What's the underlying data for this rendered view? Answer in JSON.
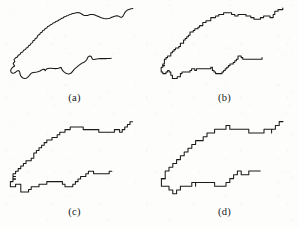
{
  "figure": {
    "kind": "multi-panel-line-figure",
    "background_color": "#fdfdfc",
    "line_color": "#1a1a1a",
    "panel_count": 4,
    "panel_layout": "2x2"
  },
  "panels": [
    {
      "id": "a",
      "caption": "(a)",
      "position": "top-left",
      "step": 0.0,
      "description": "smooth continuous coastline outline, finest resolution"
    },
    {
      "id": "b",
      "caption": "(b)",
      "position": "top-right",
      "step": 1.6,
      "description": "coastline outline, slightly coarser digitisation"
    },
    {
      "id": "c",
      "caption": "(c)",
      "position": "bottom-left",
      "step": 2.6,
      "description": "coastline outline, coarse digitisation with visible steps"
    },
    {
      "id": "d",
      "caption": "(d)",
      "position": "bottom-right",
      "step": 3.8,
      "description": "coastline outline, coarsest digitisation, strongly stair-stepped"
    }
  ],
  "chart_data": {
    "type": "line",
    "title": "",
    "xlabel": "",
    "ylabel": "",
    "xlim": [
      0,
      149
    ],
    "ylim": [
      0,
      96
    ],
    "grid": false,
    "legend": "none",
    "series": [
      {
        "name": "north-coast",
        "comment": "upper shoreline, traced left tip to right tip",
        "points": [
          [
            14.5,
            66.0
          ],
          [
            13.2,
            63.4
          ],
          [
            14.8,
            61.6
          ],
          [
            14.0,
            59.5
          ],
          [
            15.6,
            57.8
          ],
          [
            17.4,
            57.0
          ],
          [
            18.2,
            55.2
          ],
          [
            20.0,
            54.4
          ],
          [
            21.0,
            52.6
          ],
          [
            22.8,
            51.9
          ],
          [
            23.6,
            50.2
          ],
          [
            25.4,
            49.6
          ],
          [
            26.3,
            48.0
          ],
          [
            27.8,
            47.4
          ],
          [
            28.6,
            45.8
          ],
          [
            30.2,
            45.0
          ],
          [
            31.0,
            43.4
          ],
          [
            32.6,
            42.6
          ],
          [
            33.0,
            40.8
          ],
          [
            34.6,
            40.2
          ],
          [
            35.2,
            38.6
          ],
          [
            36.8,
            38.0
          ],
          [
            37.4,
            36.4
          ],
          [
            38.2,
            35.0
          ],
          [
            39.8,
            34.4
          ],
          [
            40.4,
            32.8
          ],
          [
            42.0,
            32.2
          ],
          [
            42.8,
            30.6
          ],
          [
            44.4,
            30.0
          ],
          [
            45.2,
            28.6
          ],
          [
            46.8,
            28.0
          ],
          [
            47.6,
            26.6
          ],
          [
            49.2,
            26.0
          ],
          [
            50.4,
            24.8
          ],
          [
            52.0,
            24.2
          ],
          [
            53.2,
            23.0
          ],
          [
            54.8,
            22.6
          ],
          [
            56.0,
            21.4
          ],
          [
            57.6,
            21.0
          ],
          [
            58.8,
            20.0
          ],
          [
            60.2,
            19.4
          ],
          [
            61.4,
            18.4
          ],
          [
            62.8,
            18.0
          ],
          [
            64.0,
            17.0
          ],
          [
            65.4,
            16.6
          ],
          [
            66.8,
            15.8
          ],
          [
            68.2,
            15.4
          ],
          [
            69.6,
            14.6
          ],
          [
            71.0,
            14.2
          ],
          [
            72.4,
            13.6
          ],
          [
            73.8,
            13.4
          ],
          [
            75.2,
            13.0
          ],
          [
            76.6,
            12.8
          ],
          [
            78.0,
            12.6
          ],
          [
            79.4,
            12.8
          ],
          [
            80.8,
            13.4
          ],
          [
            82.0,
            14.2
          ],
          [
            83.2,
            15.0
          ],
          [
            84.6,
            15.4
          ],
          [
            86.0,
            15.6
          ],
          [
            87.4,
            15.4
          ],
          [
            88.8,
            15.0
          ],
          [
            90.2,
            14.6
          ],
          [
            91.6,
            14.4
          ],
          [
            93.0,
            14.4
          ],
          [
            94.4,
            14.8
          ],
          [
            95.8,
            15.4
          ],
          [
            97.2,
            16.0
          ],
          [
            98.6,
            16.6
          ],
          [
            100.0,
            17.2
          ],
          [
            101.4,
            17.8
          ],
          [
            102.8,
            18.2
          ],
          [
            104.2,
            18.6
          ],
          [
            105.6,
            18.8
          ],
          [
            107.0,
            18.8
          ],
          [
            108.4,
            18.6
          ],
          [
            109.8,
            18.2
          ],
          [
            111.2,
            17.6
          ],
          [
            112.6,
            17.0
          ],
          [
            114.0,
            16.4
          ],
          [
            115.4,
            16.0
          ],
          [
            116.8,
            15.8
          ],
          [
            118.2,
            16.0
          ],
          [
            119.4,
            16.6
          ],
          [
            120.6,
            17.2
          ],
          [
            121.8,
            17.2
          ],
          [
            122.8,
            16.4
          ],
          [
            123.6,
            15.0
          ],
          [
            124.4,
            13.4
          ],
          [
            125.4,
            11.8
          ],
          [
            126.6,
            10.6
          ],
          [
            128.0,
            9.8
          ],
          [
            129.6,
            9.2
          ],
          [
            131.2,
            8.8
          ],
          [
            132.8,
            8.6
          ]
        ]
      },
      {
        "name": "south-coast",
        "comment": "lower shoreline, traced left tip to right tip",
        "points": [
          [
            14.5,
            66.0
          ],
          [
            12.6,
            67.4
          ],
          [
            11.2,
            69.0
          ],
          [
            10.6,
            70.8
          ],
          [
            11.2,
            72.4
          ],
          [
            12.6,
            73.2
          ],
          [
            14.2,
            73.0
          ],
          [
            15.6,
            72.2
          ],
          [
            16.8,
            71.2
          ],
          [
            18.0,
            70.6
          ],
          [
            19.2,
            71.0
          ],
          [
            19.8,
            72.4
          ],
          [
            20.0,
            74.0
          ],
          [
            20.6,
            75.6
          ],
          [
            21.6,
            77.0
          ],
          [
            23.0,
            78.0
          ],
          [
            24.6,
            78.4
          ],
          [
            26.2,
            78.2
          ],
          [
            27.6,
            77.4
          ],
          [
            28.8,
            76.2
          ],
          [
            29.8,
            74.8
          ],
          [
            30.8,
            73.6
          ],
          [
            32.2,
            72.8
          ],
          [
            33.8,
            72.4
          ],
          [
            35.4,
            72.2
          ],
          [
            37.0,
            72.0
          ],
          [
            38.6,
            71.6
          ],
          [
            40.0,
            71.0
          ],
          [
            41.2,
            70.2
          ],
          [
            42.4,
            69.6
          ],
          [
            43.6,
            69.2
          ],
          [
            44.6,
            69.6
          ],
          [
            45.2,
            70.8
          ],
          [
            45.8,
            69.8
          ],
          [
            46.8,
            68.8
          ],
          [
            48.2,
            68.4
          ],
          [
            49.8,
            68.2
          ],
          [
            51.4,
            68.2
          ],
          [
            53.0,
            68.4
          ],
          [
            54.6,
            68.6
          ],
          [
            56.2,
            68.6
          ],
          [
            57.8,
            68.4
          ],
          [
            59.2,
            68.0
          ],
          [
            60.4,
            67.4
          ],
          [
            61.4,
            67.8
          ],
          [
            61.8,
            69.0
          ],
          [
            62.4,
            70.2
          ],
          [
            63.4,
            71.4
          ],
          [
            64.6,
            72.4
          ],
          [
            66.0,
            73.2
          ],
          [
            67.4,
            73.8
          ],
          [
            68.8,
            74.0
          ],
          [
            70.2,
            73.6
          ],
          [
            71.4,
            72.8
          ],
          [
            72.4,
            71.6
          ],
          [
            73.4,
            70.4
          ],
          [
            74.4,
            69.2
          ],
          [
            75.6,
            68.2
          ],
          [
            76.8,
            67.2
          ],
          [
            78.0,
            66.2
          ],
          [
            79.2,
            65.2
          ],
          [
            80.4,
            64.2
          ],
          [
            81.6,
            63.4
          ],
          [
            82.8,
            62.8
          ],
          [
            84.0,
            62.2
          ],
          [
            85.2,
            61.4
          ],
          [
            86.2,
            60.4
          ],
          [
            87.0,
            59.2
          ],
          [
            87.6,
            57.8
          ],
          [
            88.4,
            56.6
          ],
          [
            89.6,
            56.0
          ],
          [
            90.8,
            56.2
          ],
          [
            91.6,
            57.2
          ],
          [
            92.0,
            58.4
          ],
          [
            92.6,
            59.2
          ],
          [
            93.8,
            59.4
          ],
          [
            95.2,
            59.2
          ],
          [
            96.8,
            59.0
          ],
          [
            98.4,
            58.8
          ],
          [
            100.0,
            58.6
          ],
          [
            101.6,
            58.6
          ],
          [
            103.2,
            58.6
          ],
          [
            104.8,
            58.6
          ],
          [
            106.4,
            58.6
          ],
          [
            108.0,
            58.4
          ],
          [
            109.6,
            58.4
          ],
          [
            111.2,
            58.2
          ]
        ]
      }
    ]
  }
}
